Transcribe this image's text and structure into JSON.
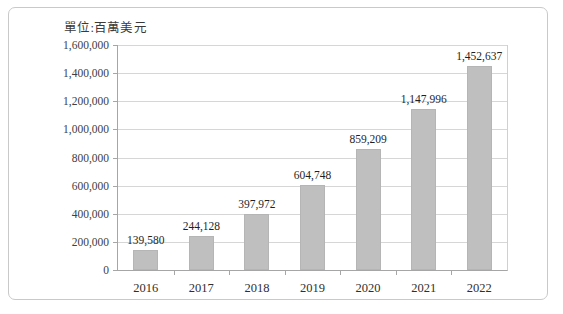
{
  "chart_data": {
    "type": "bar",
    "title": "單位:百萬美元",
    "xlabel": "",
    "ylabel": "",
    "categories": [
      "2016",
      "2017",
      "2018",
      "2019",
      "2020",
      "2021",
      "2022"
    ],
    "values": [
      139580,
      244128,
      397972,
      604748,
      859209,
      1147996,
      1452637
    ],
    "value_labels": [
      "139,580",
      "244,128",
      "397,972",
      "604,748",
      "859,209",
      "1,147,996",
      "1,452,637"
    ],
    "ylim": [
      0,
      1600000
    ],
    "ytick_step": 200000,
    "ytick_labels": [
      "1,600,000",
      "1,400,000",
      "1,200,000",
      "1,000,000",
      "800,000",
      "600,000",
      "400,000",
      "200,000",
      "0"
    ],
    "ytick_values": [
      1600000,
      1400000,
      1200000,
      1000000,
      800000,
      600000,
      400000,
      200000,
      0
    ],
    "grid": true,
    "legend": false,
    "series": [
      {
        "name": "",
        "values": [
          139580,
          244128,
          397972,
          604748,
          859209,
          1147996,
          1452637
        ]
      }
    ],
    "colors": {
      "bar": "#bfbfbf",
      "gridline": "#d6d6d6",
      "axis": "#a6a6a6",
      "text": "#1f1f1f",
      "frame_border": "#c9c9c9"
    }
  }
}
